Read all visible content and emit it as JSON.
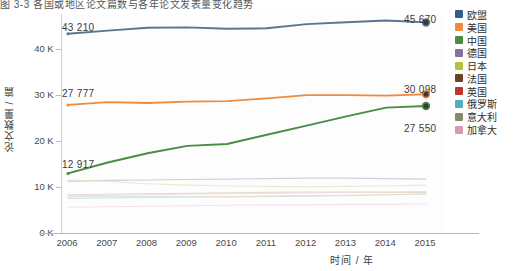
{
  "caption": {
    "text": "图 3-3   各国或地区论文篇数与各年论文发表量变化趋势"
  },
  "axes": {
    "y_title": "论文数量 / 篇",
    "x_title": "时间 / 年",
    "y_ticks": [
      "0 K",
      "10 K",
      "20 K",
      "30 K",
      "40 K"
    ],
    "y_tick_values": [
      0,
      10000,
      20000,
      30000,
      40000
    ],
    "x_ticks": [
      "2006",
      "2007",
      "2008",
      "2009",
      "2010",
      "2011",
      "2012",
      "2013",
      "2014",
      "2015"
    ]
  },
  "value_labels": {
    "eu_start": "43 210",
    "eu_end": "45 670",
    "us_start": "27 777",
    "us_end": "30 098",
    "cn_end": "27 550",
    "cn_start": "12 917"
  },
  "legend": {
    "items": [
      {
        "label": "欧盟",
        "color": "#37598c"
      },
      {
        "label": "美国",
        "color": "#ef8b3c"
      },
      {
        "label": "中国",
        "color": "#4a8b45"
      },
      {
        "label": "德国",
        "color": "#8b6f9e"
      },
      {
        "label": "日本",
        "color": "#b5c23c"
      },
      {
        "label": "法国",
        "color": "#6b4226"
      },
      {
        "label": "英国",
        "color": "#c0342c"
      },
      {
        "label": "俄罗斯",
        "color": "#4fb3bf"
      },
      {
        "label": "意大利",
        "color": "#87896f"
      },
      {
        "label": "加拿大",
        "color": "#d99aad"
      }
    ]
  },
  "chart_data": {
    "type": "line",
    "title": "图 3-3   各国或地区论文篇数与各年论文发表量变化趋势",
    "xlabel": "时间 / 年",
    "ylabel": "论文数量 / 篇",
    "x": [
      2006,
      2007,
      2008,
      2009,
      2010,
      2011,
      2012,
      2013,
      2014,
      2015
    ],
    "ylim": [
      0,
      47500
    ],
    "xlim": [
      2006,
      2015
    ],
    "grid": false,
    "legend_position": "right",
    "series": [
      {
        "name": "欧盟",
        "color": "#5b7490",
        "emphasis": "high",
        "values": [
          43210,
          43900,
          44500,
          44600,
          44300,
          44400,
          45300,
          45700,
          46100,
          45670
        ]
      },
      {
        "name": "美国",
        "color": "#ef8b3c",
        "emphasis": "high",
        "values": [
          27777,
          28400,
          28200,
          28500,
          28600,
          29200,
          29900,
          29900,
          29800,
          30098
        ]
      },
      {
        "name": "中国",
        "color": "#4a8b45",
        "emphasis": "high",
        "values": [
          12917,
          15300,
          17300,
          18900,
          19300,
          21300,
          23300,
          25300,
          27200,
          27550
        ]
      },
      {
        "name": "德国",
        "color": "#c9c5d2",
        "emphasis": "low",
        "values": [
          11200,
          11400,
          11500,
          11600,
          11700,
          11800,
          11900,
          11900,
          11800,
          11700
        ]
      },
      {
        "name": "日本",
        "color": "#e6e6c4",
        "emphasis": "low",
        "values": [
          11500,
          11200,
          10700,
          10400,
          10200,
          10100,
          10000,
          10100,
          10200,
          10400
        ]
      },
      {
        "name": "法国",
        "color": "#e0d4c6",
        "emphasis": "low",
        "values": [
          8300,
          8400,
          8500,
          8600,
          8700,
          8800,
          8900,
          8900,
          8800,
          8800
        ]
      },
      {
        "name": "英国",
        "color": "#f0d9d4",
        "emphasis": "low",
        "values": [
          8100,
          8200,
          8300,
          8400,
          8500,
          8600,
          8700,
          8800,
          8900,
          9000
        ]
      },
      {
        "name": "俄罗斯",
        "color": "#cfe6e9",
        "emphasis": "low",
        "values": [
          7900,
          7900,
          7900,
          7900,
          7800,
          7900,
          8000,
          8100,
          8300,
          8500
        ]
      },
      {
        "name": "意大利",
        "color": "#dcdcd2",
        "emphasis": "low",
        "values": [
          7500,
          7600,
          7700,
          7800,
          7900,
          8000,
          8100,
          8200,
          8300,
          8400
        ]
      },
      {
        "name": "加拿大",
        "color": "#f2dde3",
        "emphasis": "low",
        "values": [
          5600,
          5700,
          5800,
          5900,
          6000,
          6100,
          6100,
          6200,
          6200,
          6300
        ]
      }
    ]
  }
}
